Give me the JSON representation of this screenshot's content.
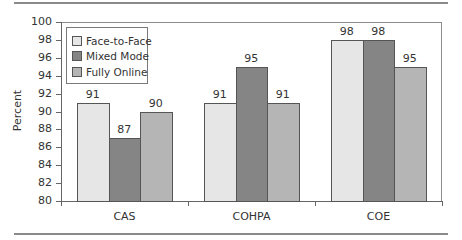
{
  "chart_data": {
    "type": "bar",
    "title": "",
    "xlabel": "",
    "ylabel": "Percent",
    "ylim": [
      80,
      100
    ],
    "yticks": [
      80,
      82,
      84,
      86,
      88,
      90,
      92,
      94,
      96,
      98,
      100
    ],
    "categories": [
      "CAS",
      "COHPA",
      "COE"
    ],
    "series": [
      {
        "name": "Face-to-Face",
        "color": "#e6e6e6",
        "values": [
          91,
          91,
          98
        ]
      },
      {
        "name": "Mixed Mode",
        "color": "#858585",
        "values": [
          87,
          95,
          98
        ]
      },
      {
        "name": "Fully Online",
        "color": "#b5b5b5",
        "values": [
          90,
          91,
          95
        ]
      }
    ],
    "data_labels": true,
    "grid": false,
    "legend_position": "upper-left-inside"
  }
}
